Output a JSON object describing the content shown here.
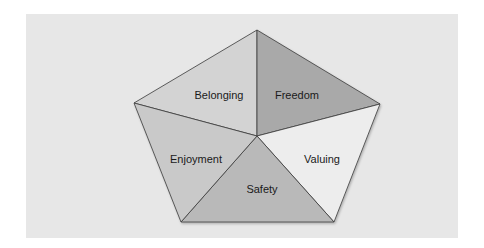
{
  "diagram": {
    "title": "",
    "type": "pentagon-segments",
    "segments": [
      {
        "label": "Belonging",
        "color": "#d3d3d3"
      },
      {
        "label": "Freedom",
        "color": "#a9a9a9"
      },
      {
        "label": "Valuing",
        "color": "#ededed"
      },
      {
        "label": "Safety",
        "color": "#b9b9b9"
      },
      {
        "label": "Enjoyment",
        "color": "#c9c9c9"
      }
    ],
    "background_color": "#e7e7e7",
    "stroke_color": "#3a3a3a"
  }
}
